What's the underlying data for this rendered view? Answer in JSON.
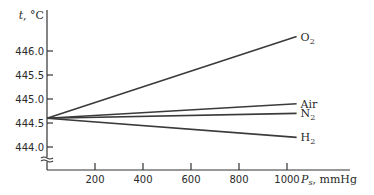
{
  "chart_data": {
    "type": "line",
    "title": "",
    "xlabel": "P_s, mmHg",
    "xlabel_main": "P",
    "xlabel_sub": "s",
    "xlabel_unit": ", mmHg",
    "ylabel": "t, °C",
    "xlim": [
      0,
      1100
    ],
    "ylim": [
      443.7,
      446.5
    ],
    "x_ticks": [
      200,
      400,
      600,
      800,
      1000
    ],
    "y_ticks": [
      444.0,
      444.5,
      445.0,
      445.5,
      446.0
    ],
    "x_tick_labels": [
      "200",
      "400",
      "600",
      "800",
      "1000"
    ],
    "y_tick_labels": [
      "444.0",
      "444.5",
      "445.0",
      "445.5",
      "446.0"
    ],
    "y_axis_break": true,
    "grid": false,
    "legend": "inline labels at line ends",
    "x": [
      0,
      1040
    ],
    "series": [
      {
        "name": "O2",
        "label_main": "O",
        "label_sub": "2",
        "values": [
          444.6,
          446.3
        ]
      },
      {
        "name": "Air",
        "label_main": "Air",
        "label_sub": "",
        "values": [
          444.6,
          444.9
        ]
      },
      {
        "name": "N2",
        "label_main": "N",
        "label_sub": "2",
        "values": [
          444.6,
          444.7
        ]
      },
      {
        "name": "H2",
        "label_main": "H",
        "label_sub": "2",
        "values": [
          444.6,
          444.2
        ]
      }
    ]
  },
  "colors": {
    "axis": "#333333",
    "line": "#3a3a3a",
    "text": "#2a2a2a",
    "background": "#ffffff"
  }
}
